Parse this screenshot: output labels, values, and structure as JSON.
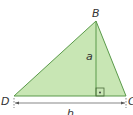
{
  "figure": {
    "vertices": {
      "B": {
        "label": "B",
        "x": 96,
        "y": 21
      },
      "D": {
        "label": "D",
        "x": 14,
        "y": 96
      },
      "C": {
        "label": "C",
        "x": 126,
        "y": 96
      }
    },
    "altitude_label": "a",
    "base_label": "h",
    "right_angle_marker": "right-angle",
    "colors": {
      "fill": "#c8e6b4",
      "stroke": "#5a9a4a",
      "dimension": "#555555",
      "text": "#333333"
    }
  }
}
